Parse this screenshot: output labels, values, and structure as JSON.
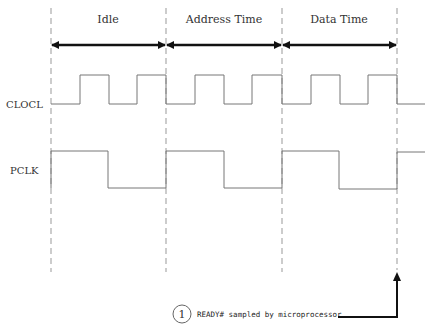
{
  "diagram": {
    "type": "timing-diagram",
    "phases": [
      {
        "label": "Idle"
      },
      {
        "label": "Address Time"
      },
      {
        "label": "Data Time"
      }
    ],
    "signals": [
      {
        "name": "CLOCL"
      },
      {
        "name": "PCLK"
      }
    ],
    "annotation": {
      "number": "1",
      "text": "READY# sampled by microprocessor"
    },
    "colors": {
      "line": "#777777",
      "arrow": "#111111",
      "dash": "#999999"
    }
  }
}
